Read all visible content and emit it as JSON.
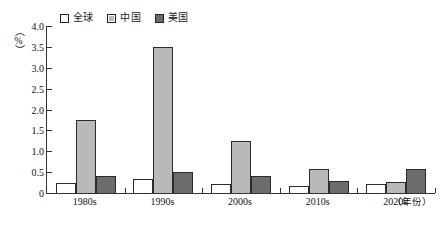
{
  "chart_data": {
    "type": "bar",
    "title": "",
    "xlabel": "（年份）",
    "ylabel": "（%）",
    "ylim": [
      0,
      4.0
    ],
    "ytick_labels": [
      "4.0",
      "3.5",
      "3.0",
      "2.5",
      "2.0",
      "1.5",
      "1.0",
      "0.5",
      "0"
    ],
    "ytick_values": [
      4.0,
      3.5,
      3.0,
      2.5,
      2.0,
      1.5,
      1.0,
      0.5,
      0
    ],
    "grid": false,
    "legend_position": "top-left",
    "categories": [
      "1980s",
      "1990s",
      "2000s",
      "2010s",
      "2020s"
    ],
    "series": [
      {
        "name": "全球",
        "color": "#ffffff",
        "values": [
          0.25,
          0.33,
          0.22,
          0.18,
          0.21
        ]
      },
      {
        "name": "中国",
        "color": "#b9b9b9",
        "values": [
          1.75,
          3.5,
          1.25,
          0.58,
          0.26
        ]
      },
      {
        "name": "美国",
        "color": "#6c6c6c",
        "values": [
          0.4,
          0.51,
          0.4,
          0.28,
          0.58
        ]
      }
    ]
  }
}
